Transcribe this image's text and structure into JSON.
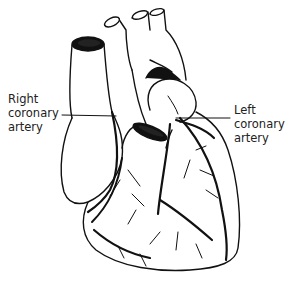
{
  "diagram": {
    "labels": {
      "right_coronary": {
        "line1": "Right",
        "line2": "coronary",
        "line3": "artery"
      },
      "left_coronary": {
        "line1": "Left",
        "line2": "coronary",
        "line3": "artery"
      }
    },
    "colors": {
      "ink": "#111111",
      "background": "#ffffff",
      "label_text": "#222222"
    }
  }
}
